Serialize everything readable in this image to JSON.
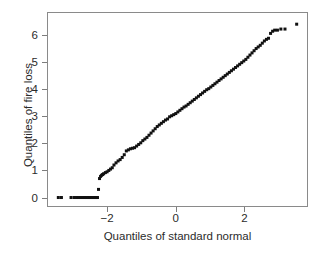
{
  "chart_data": {
    "type": "scatter",
    "title": "",
    "xlabel": "Quantiles of standard normal",
    "ylabel": "Quantiles of fire loss",
    "xlim": [
      -3.75,
      3.85
    ],
    "ylim": [
      -0.35,
      6.85
    ],
    "xticks": [
      -2,
      0,
      2
    ],
    "xticklabels": [
      "-2",
      "0",
      "2"
    ],
    "yticks": [
      0,
      1,
      2,
      3,
      4,
      5,
      6
    ],
    "yticklabels": [
      "0",
      "1",
      "2",
      "3",
      "4",
      "5",
      "6"
    ],
    "grid": false,
    "legend": null,
    "marker": "filled-square",
    "marker_color": "#111111",
    "marker_size_px": 3,
    "frame": true,
    "series": [
      {
        "name": "fire loss quantiles",
        "x": [
          -3.42,
          -3.33,
          -3.05,
          -2.96,
          -2.89,
          -2.82,
          -2.76,
          -2.7,
          -2.65,
          -2.6,
          -2.55,
          -2.51,
          -2.47,
          -2.43,
          -2.39,
          -2.35,
          -2.32,
          -2.28,
          -2.25,
          -2.22,
          -2.19,
          -2.16,
          -2.13,
          -2.1,
          -2.05,
          -2.0,
          -1.95,
          -1.9,
          -1.85,
          -1.8,
          -1.74,
          -1.68,
          -1.62,
          -1.56,
          -1.5,
          -1.44,
          -1.38,
          -1.32,
          -1.26,
          -1.2,
          -1.14,
          -1.08,
          -1.02,
          -0.96,
          -0.9,
          -0.84,
          -0.78,
          -0.72,
          -0.66,
          -0.6,
          -0.54,
          -0.48,
          -0.42,
          -0.36,
          -0.3,
          -0.24,
          -0.18,
          -0.12,
          -0.06,
          0.0,
          0.06,
          0.12,
          0.18,
          0.24,
          0.3,
          0.36,
          0.42,
          0.48,
          0.54,
          0.6,
          0.66,
          0.72,
          0.78,
          0.84,
          0.9,
          0.96,
          1.02,
          1.08,
          1.14,
          1.2,
          1.26,
          1.32,
          1.38,
          1.44,
          1.5,
          1.56,
          1.62,
          1.68,
          1.74,
          1.8,
          1.86,
          1.92,
          1.98,
          2.04,
          2.1,
          2.16,
          2.22,
          2.28,
          2.34,
          2.4,
          2.46,
          2.52,
          2.58,
          2.64,
          2.7,
          2.76,
          2.82,
          2.88,
          2.96,
          3.06,
          3.18,
          3.52
        ],
        "y": [
          0.0,
          0.0,
          0.0,
          0.0,
          0.0,
          0.0,
          0.0,
          0.0,
          0.0,
          0.0,
          0.0,
          0.0,
          0.0,
          0.0,
          0.0,
          0.0,
          0.0,
          0.0,
          0.3,
          0.7,
          0.78,
          0.82,
          0.85,
          0.88,
          0.92,
          0.95,
          1.0,
          1.05,
          1.1,
          1.2,
          1.28,
          1.35,
          1.4,
          1.48,
          1.58,
          1.72,
          1.76,
          1.8,
          1.82,
          1.84,
          1.9,
          1.96,
          2.02,
          2.1,
          2.16,
          2.22,
          2.3,
          2.38,
          2.46,
          2.54,
          2.62,
          2.68,
          2.74,
          2.8,
          2.86,
          2.9,
          2.98,
          3.02,
          3.06,
          3.1,
          3.16,
          3.22,
          3.28,
          3.34,
          3.38,
          3.44,
          3.5,
          3.56,
          3.62,
          3.68,
          3.74,
          3.8,
          3.86,
          3.92,
          3.98,
          4.02,
          4.08,
          4.14,
          4.2,
          4.26,
          4.32,
          4.38,
          4.44,
          4.5,
          4.56,
          4.62,
          4.68,
          4.74,
          4.8,
          4.86,
          4.92,
          4.98,
          5.04,
          5.1,
          5.18,
          5.26,
          5.34,
          5.42,
          5.5,
          5.56,
          5.62,
          5.7,
          5.78,
          5.84,
          5.88,
          6.06,
          6.14,
          6.18,
          6.18,
          6.22,
          6.22,
          6.4
        ]
      }
    ]
  }
}
